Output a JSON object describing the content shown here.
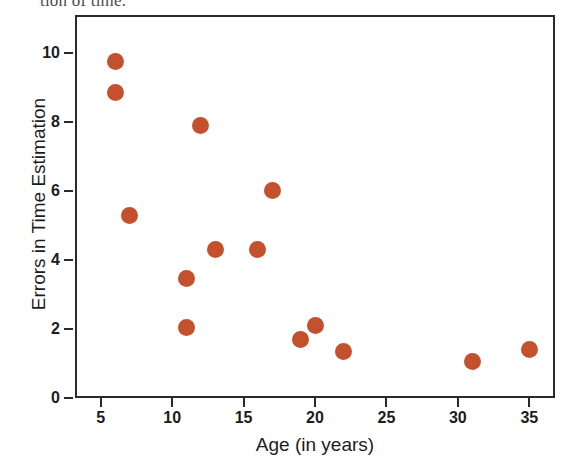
{
  "page": {
    "bleed_text": "tion of time."
  },
  "chart_data": {
    "type": "scatter",
    "title": "",
    "xlabel": "Age (in years)",
    "ylabel": "Errors in Time Estimation",
    "xlim": [
      3.2,
      36.8
    ],
    "ylim": [
      0,
      11.1
    ],
    "xticks": [
      5,
      10,
      15,
      20,
      25,
      30,
      35
    ],
    "yticks": [
      0,
      2,
      4,
      6,
      8,
      10
    ],
    "xtick_labels": [
      "5",
      "10",
      "15",
      "20",
      "25",
      "30",
      "35"
    ],
    "ytick_labels": [
      "0",
      "2",
      "4",
      "6",
      "8",
      "10"
    ],
    "grid": false,
    "legend": false,
    "marker_color": "#C4512E",
    "marker_size": 17,
    "axis_color": "#2a2a2a",
    "x": [
      6,
      6,
      7,
      11,
      11,
      12,
      13,
      16,
      17,
      19,
      20,
      22,
      31,
      35
    ],
    "y": [
      9.75,
      8.85,
      5.3,
      3.45,
      2.05,
      7.9,
      4.3,
      4.3,
      6.0,
      1.7,
      2.1,
      1.35,
      1.05,
      1.4
    ],
    "points": [
      {
        "x": 6,
        "y": 9.75
      },
      {
        "x": 6,
        "y": 8.85
      },
      {
        "x": 7,
        "y": 5.3
      },
      {
        "x": 11,
        "y": 3.45
      },
      {
        "x": 11,
        "y": 2.05
      },
      {
        "x": 12,
        "y": 7.9
      },
      {
        "x": 13,
        "y": 4.3
      },
      {
        "x": 16,
        "y": 4.3
      },
      {
        "x": 17,
        "y": 6.0
      },
      {
        "x": 19,
        "y": 1.7
      },
      {
        "x": 20,
        "y": 2.1
      },
      {
        "x": 22,
        "y": 1.35
      },
      {
        "x": 31,
        "y": 1.05
      },
      {
        "x": 35,
        "y": 1.4
      }
    ]
  }
}
